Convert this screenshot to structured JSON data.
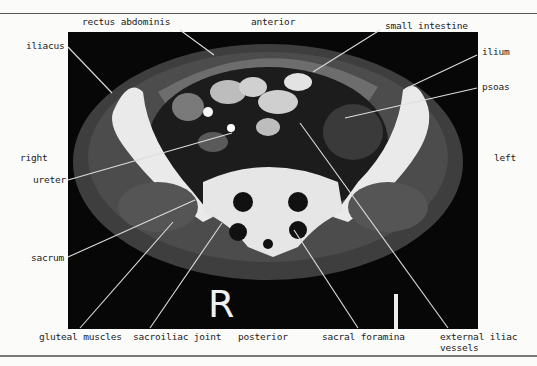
{
  "figure": {
    "orientation": {
      "anterior": "anterior",
      "posterior": "posterior",
      "right": "right",
      "left": "left"
    },
    "markers": {
      "right_marker": "R",
      "left_marker": "L"
    },
    "labels": {
      "rectus_abdominis": "rectus abdominis",
      "small_intestine": "small intestine",
      "iliacus": "iliacus",
      "ilium": "ilium",
      "psoas": "psoas",
      "ureter": "ureter",
      "sacrum": "sacrum",
      "gluteal_muscles": "gluteal muscles",
      "sacroiliac_joint": "sacroiliac joint",
      "sacral_foramina": "sacral foramina",
      "external_iliac_line1": "external iliac",
      "external_iliac_line2": "vessels"
    },
    "colors": {
      "background": "#fbfbfa",
      "image_bg": "#070707",
      "bone": "#eeeeee",
      "soft_tissue": "#5a5a5a",
      "leader_line": "#dddddd"
    }
  }
}
